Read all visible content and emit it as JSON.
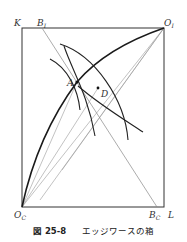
{
  "figure": {
    "caption_number": "図 25-8",
    "caption_text": "エッジワースの箱",
    "labels": {
      "K": "K",
      "B_I": {
        "main": "B",
        "sub": "I"
      },
      "O_I": {
        "main": "O",
        "sub": "I"
      },
      "A": "A",
      "D": "D",
      "O_C": {
        "main": "O",
        "sub": "C"
      },
      "B_C": {
        "main": "B",
        "sub": "C"
      },
      "L": "L"
    },
    "colors": {
      "box": "#333333",
      "contract_curve": "#1a1a1a",
      "indifference": "#222222",
      "thin_lines": "#888888"
    }
  }
}
